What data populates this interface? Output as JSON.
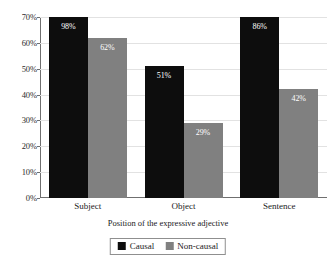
{
  "chart_data": {
    "type": "bar",
    "title": "",
    "xlabel": "Position of the expressive adjective",
    "ylabel": "",
    "categories": [
      "Subject",
      "Object",
      "Sentence"
    ],
    "series": [
      {
        "name": "Causal",
        "color": "#0d0d0d",
        "values": [
          98,
          51,
          86
        ],
        "labels": [
          "98%",
          "51%",
          "86%"
        ]
      },
      {
        "name": "Non-causal",
        "color": "#808080",
        "values": [
          62,
          29,
          42
        ],
        "labels": [
          "62%",
          "29%",
          "42%"
        ]
      }
    ],
    "ylim": [
      0,
      70
    ],
    "ytick_labels": [
      "70%",
      "60%",
      "50%",
      "40%",
      "30%",
      "20%",
      "10%",
      "0%"
    ],
    "ytick_values": [
      70,
      60,
      50,
      40,
      30,
      20,
      10,
      0
    ],
    "grid": true,
    "legend_position": "bottom",
    "note": "Bars exceeding the 70% axis maximum are clipped at the plot top."
  },
  "legend": {
    "items": [
      {
        "label": "Causal",
        "swatch": "causal"
      },
      {
        "label": "Non-causal",
        "swatch": "noncausal"
      }
    ]
  }
}
